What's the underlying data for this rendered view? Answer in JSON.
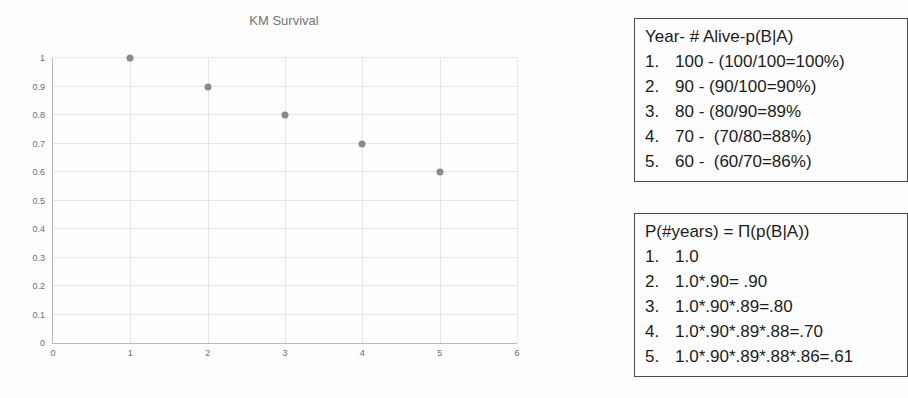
{
  "chart_data": {
    "type": "scatter",
    "title": "KM Survival",
    "x": [
      1,
      2,
      3,
      4,
      5
    ],
    "y": [
      1.0,
      0.9,
      0.8,
      0.7,
      0.6
    ],
    "xlim": [
      0,
      6
    ],
    "ylim": [
      0,
      1
    ],
    "x_ticks": [
      "0",
      "1",
      "2",
      "3",
      "4",
      "5",
      "6"
    ],
    "y_ticks": [
      "0",
      "0.1",
      "0.2",
      "0.3",
      "0.4",
      "0.5",
      "0.6",
      "0.7",
      "0.8",
      "0.9",
      "1"
    ],
    "grid": true,
    "legend": "none",
    "xlabel": "",
    "ylabel": "",
    "point_color": "#8a8a8a",
    "title_color": "#757575"
  },
  "panels": [
    {
      "title": "Year- # Alive-p(B|A)",
      "items": [
        {
          "num": "1.",
          "text": "100 - (100/100=100%)"
        },
        {
          "num": "2.",
          "text": "90 - (90/100=90%)"
        },
        {
          "num": "3.",
          "text": "80 - (80/90=89%"
        },
        {
          "num": "4.",
          "text": "70 -  (70/80=88%)"
        },
        {
          "num": "5.",
          "text": "60 -  (60/70=86%)"
        }
      ]
    },
    {
      "title": "P(#years) = Π(p(B|A))",
      "items": [
        {
          "num": "1.",
          "text": "1.0"
        },
        {
          "num": "2.",
          "text": "1.0*.90= .90"
        },
        {
          "num": "3.",
          "text": "1.0*.90*.89=.80"
        },
        {
          "num": "4.",
          "text": "1.0*.90*.89*.88=.70"
        },
        {
          "num": "5.",
          "text": "1.0*.90*.89*.88*.86=.61"
        }
      ]
    }
  ]
}
